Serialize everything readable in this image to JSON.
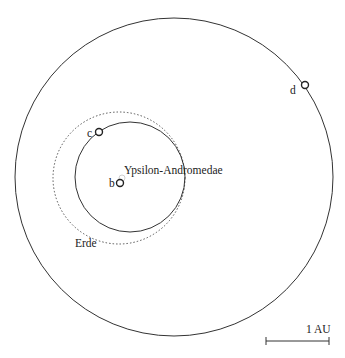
{
  "diagram": {
    "star": {
      "label": "Ypsilon-Andromedae"
    },
    "planets": [
      {
        "label": "b"
      },
      {
        "label": "c"
      },
      {
        "label": "d"
      }
    ],
    "reference_orbit": {
      "label": "Erde"
    },
    "scale_bar": {
      "label": "1 AU"
    }
  }
}
